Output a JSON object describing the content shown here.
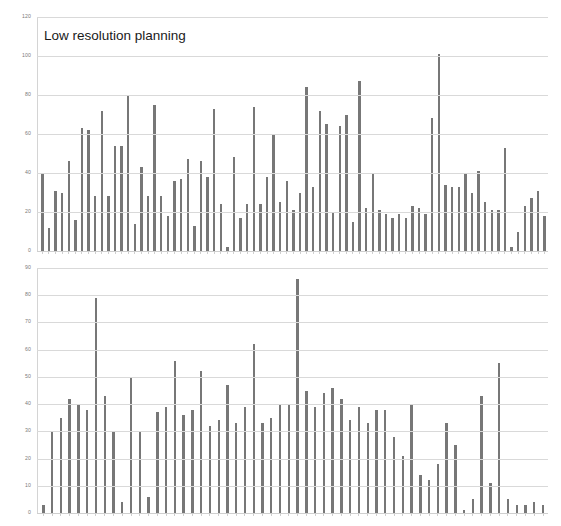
{
  "page": {
    "background": "#ffffff",
    "bar_color": "#777777",
    "grid_color": "#d9d9d9",
    "axis_color": "#d4d4d4",
    "tick_label_color": "#7b7b7b",
    "title_color": "#1a1a1a"
  },
  "chart_data": [
    {
      "type": "bar",
      "id": "low-resolution-planning",
      "title": "Low resolution planning",
      "xlabel": "",
      "ylabel": "",
      "ylim": [
        0,
        120
      ],
      "yticks": [
        0,
        20,
        40,
        60,
        80,
        100,
        120
      ],
      "ytick_labels": [
        "0",
        "20",
        "40",
        "60",
        "80",
        "100",
        "120"
      ],
      "grid": true,
      "legend": false,
      "xtick_labels": [],
      "values": [
        40,
        12,
        31,
        30,
        46,
        16,
        63,
        62,
        28,
        72,
        28,
        54,
        54,
        80,
        14,
        43,
        28,
        75,
        28,
        18,
        36,
        37,
        47,
        13,
        46,
        38,
        73,
        24,
        2,
        48,
        17,
        24,
        74,
        24,
        38,
        60,
        25,
        36,
        21,
        30,
        84,
        33,
        72,
        65,
        20,
        64,
        70,
        15,
        87,
        22,
        40,
        21,
        19,
        17,
        19,
        17,
        23,
        22,
        19,
        68,
        101,
        34,
        33,
        33,
        40,
        30,
        41,
        25,
        21,
        21,
        53,
        2,
        10,
        23,
        27,
        31,
        18
      ]
    },
    {
      "type": "bar",
      "id": "high-resolution-planning",
      "title": "High resolution planning",
      "xlabel": "",
      "ylabel": "",
      "ylim": [
        0,
        90
      ],
      "yticks": [
        0,
        10,
        20,
        30,
        40,
        50,
        60,
        70,
        80,
        90
      ],
      "ytick_labels": [
        "0",
        "10",
        "20",
        "30",
        "40",
        "50",
        "60",
        "70",
        "80",
        "90"
      ],
      "grid": true,
      "legend": false,
      "xtick_labels": [],
      "values": [
        3,
        30,
        35,
        42,
        40,
        38,
        79,
        43,
        30,
        4,
        50,
        30,
        6,
        37,
        39,
        56,
        36,
        38,
        52,
        32,
        34,
        47,
        33,
        39,
        62,
        33,
        35,
        40,
        40,
        86,
        45,
        39,
        44,
        46,
        42,
        34,
        39,
        33,
        38,
        38,
        28,
        21,
        40,
        14,
        12,
        18,
        33,
        25,
        1,
        5,
        43,
        11,
        55,
        5,
        3,
        3,
        4,
        3
      ]
    }
  ]
}
